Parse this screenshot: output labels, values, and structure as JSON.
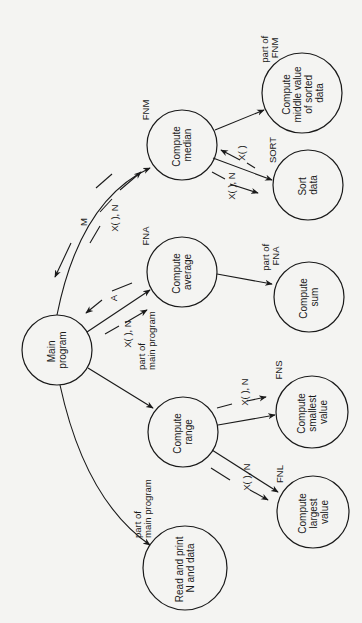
{
  "diagram": {
    "orientation": "rotated 90 degrees counterclockwise",
    "nodes": [
      {
        "id": "main",
        "lines": [
          "Main",
          "program"
        ]
      },
      {
        "id": "median",
        "lines": [
          "Compute",
          "median"
        ],
        "tag": "FNM"
      },
      {
        "id": "middle",
        "lines": [
          "Compute",
          "middle value",
          "of sorted",
          "data"
        ],
        "tag_lines": [
          "part of",
          "FNM"
        ]
      },
      {
        "id": "sort",
        "lines": [
          "Sort",
          "data"
        ],
        "tag": "SORT"
      },
      {
        "id": "average",
        "lines": [
          "Compute",
          "average"
        ],
        "tag": "FNA"
      },
      {
        "id": "sum",
        "lines": [
          "Compute",
          "sum"
        ],
        "tag_lines": [
          "part of",
          "FNA"
        ]
      },
      {
        "id": "range",
        "lines": [
          "Compute",
          "range"
        ],
        "tag_lines": [
          "part of",
          "main program"
        ]
      },
      {
        "id": "smallest",
        "lines": [
          "Compute",
          "smallest",
          "value"
        ],
        "tag": "FNS"
      },
      {
        "id": "largest",
        "lines": [
          "Compute",
          "largest",
          "value"
        ],
        "tag": "FNL"
      },
      {
        "id": "read",
        "lines": [
          "Read and print",
          "N and data"
        ],
        "tag_lines": [
          "part of",
          "main program"
        ]
      }
    ],
    "flows": {
      "main_to_median_in": "X( ), N",
      "median_to_main_out": "M",
      "main_to_average_in": "X( ), N",
      "average_to_main_out": "A",
      "median_to_sort_in": "X( ), N",
      "sort_to_median_out": "X( )",
      "range_to_smallest_in": "X( ), N",
      "range_to_largest_in": "X( ), N"
    }
  }
}
